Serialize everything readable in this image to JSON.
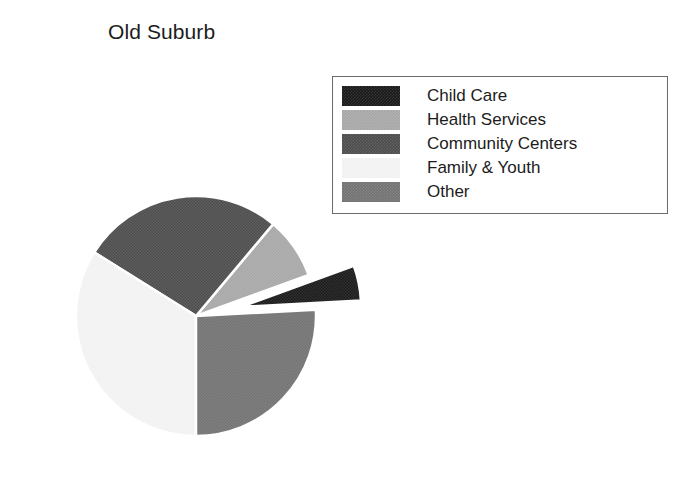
{
  "chart": {
    "title": "Old Suburb"
  },
  "legend": {
    "position": "top-right",
    "border_color": "#6b6b6b",
    "background": "#ffffff",
    "entries": [
      {
        "label": "Child Care",
        "color": "#1a1a1a"
      },
      {
        "label": "Health Services",
        "color": "#a8a8a8"
      },
      {
        "label": "Community Centers",
        "color": "#4d4d4d"
      },
      {
        "label": "Family & Youth",
        "color": "#f2f2f2"
      },
      {
        "label": "Other",
        "color": "#737373"
      }
    ]
  },
  "chart_data": {
    "type": "pie",
    "title": "Old Suburb",
    "xlabel": "",
    "ylabel": "",
    "categories": [
      "Child Care",
      "Health Services",
      "Community Centers",
      "Family & Youth",
      "Other"
    ],
    "values": [
      4.7,
      8.3,
      27.2,
      33.9,
      25.9
    ],
    "unit": "percent",
    "colors": [
      "#1a1a1a",
      "#a8a8a8",
      "#4d4d4d",
      "#f2f2f2",
      "#737373"
    ],
    "exploded": [
      "Child Care"
    ],
    "start_angle_deg": 0,
    "direction": "clockwise",
    "legend_position": "top-right",
    "grid": false,
    "data_labels": false,
    "slices": [
      {
        "label": "Child Care",
        "value": 4.7,
        "start_deg": 340.0,
        "end_deg": 357.0,
        "color": "#1a1a1a",
        "exploded": true,
        "explode_offset_px": 46
      },
      {
        "label": "Health Services",
        "value": 8.3,
        "start_deg": 310.0,
        "end_deg": 340.0,
        "color": "#a8a8a8",
        "exploded": false,
        "explode_offset_px": 0
      },
      {
        "label": "Community Centers",
        "value": 27.2,
        "start_deg": 212.0,
        "end_deg": 310.0,
        "color": "#4d4d4d",
        "exploded": false,
        "explode_offset_px": 0
      },
      {
        "label": "Family & Youth",
        "value": 33.9,
        "start_deg": 90.0,
        "end_deg": 212.0,
        "color": "#f2f2f2",
        "exploded": false,
        "explode_offset_px": 0
      },
      {
        "label": "Other",
        "value": 25.9,
        "start_deg": 357.0,
        "end_deg": 90.0,
        "color": "#737373",
        "exploded": false,
        "explode_offset_px": 0
      }
    ],
    "geometry": {
      "center_x": 196,
      "center_y": 316,
      "radius": 120
    }
  }
}
